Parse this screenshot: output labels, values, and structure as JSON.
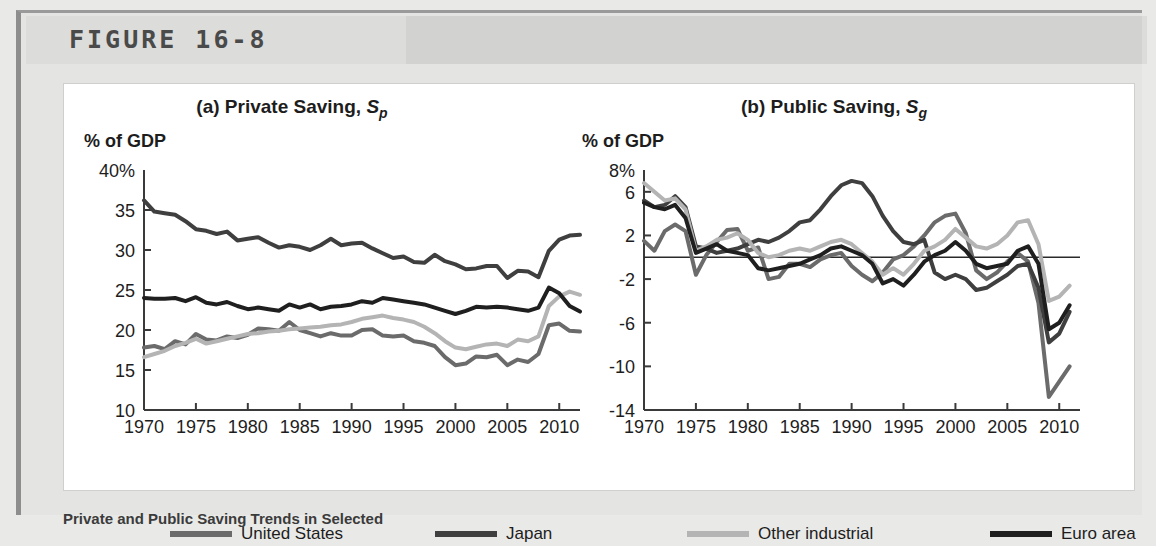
{
  "figure": {
    "label": "FIGURE 16-8",
    "caption": "Private and Public Saving Trends in Selected"
  },
  "panels": [
    {
      "key": "private",
      "title_prefix": "(a) Private Saving, ",
      "title_symbol": "S",
      "title_subscript": "p",
      "axis_unit": "% of GDP"
    },
    {
      "key": "public",
      "title_prefix": "(b) Public Saving, ",
      "title_symbol": "S",
      "title_subscript": "g",
      "axis_unit": "% of GDP"
    }
  ],
  "legend": {
    "items": [
      {
        "label": "United States",
        "color": "#6b6b6b"
      },
      {
        "label": "Japan",
        "color": "#3f3f3f"
      },
      {
        "label": "Other industrial",
        "color": "#b4b4b4"
      },
      {
        "label": "Euro area",
        "color": "#1f1f1f"
      }
    ]
  },
  "chart_data": [
    {
      "type": "line",
      "title": "(a) Private Saving, Sp",
      "xlabel": "",
      "ylabel": "% of GDP",
      "xlim": [
        1970,
        2012
      ],
      "ylim": [
        10,
        40
      ],
      "yticks": [
        10,
        15,
        20,
        25,
        30,
        35,
        40
      ],
      "yticklabels": [
        "10",
        "15",
        "20",
        "25",
        "30",
        "35",
        "40%"
      ],
      "xticks": [
        1970,
        1975,
        1980,
        1985,
        1990,
        1995,
        2000,
        2005,
        2010
      ],
      "xticklabels": [
        "1970",
        "1975",
        "1980",
        "1985",
        "1990",
        "1995",
        "2000",
        "2005",
        "2010"
      ],
      "grid": false,
      "legend": "below",
      "x": [
        1970,
        1971,
        1972,
        1973,
        1974,
        1975,
        1976,
        1977,
        1978,
        1979,
        1980,
        1981,
        1982,
        1983,
        1984,
        1985,
        1986,
        1987,
        1988,
        1989,
        1990,
        1991,
        1992,
        1993,
        1994,
        1995,
        1996,
        1997,
        1998,
        1999,
        2000,
        2001,
        2002,
        2003,
        2004,
        2005,
        2006,
        2007,
        2008,
        2009,
        2010,
        2011,
        2012
      ],
      "series": [
        {
          "name": "United States",
          "color": "#6b6b6b",
          "values": [
            17.8,
            18.0,
            17.6,
            18.6,
            18.2,
            19.5,
            18.8,
            18.7,
            19.2,
            19.0,
            19.4,
            20.2,
            20.1,
            19.9,
            21.0,
            20.0,
            19.6,
            19.2,
            19.6,
            19.3,
            19.3,
            20.0,
            20.1,
            19.3,
            19.2,
            19.3,
            18.6,
            18.4,
            18.0,
            16.6,
            15.6,
            15.8,
            16.7,
            16.6,
            16.9,
            15.6,
            16.3,
            16.0,
            17.0,
            20.6,
            20.8,
            19.9,
            19.8
          ]
        },
        {
          "name": "Japan",
          "color": "#3f3f3f",
          "values": [
            36.2,
            34.8,
            34.6,
            34.4,
            33.6,
            32.6,
            32.4,
            32.0,
            32.3,
            31.2,
            31.4,
            31.6,
            30.9,
            30.3,
            30.6,
            30.4,
            30.0,
            30.6,
            31.4,
            30.6,
            30.8,
            30.9,
            30.2,
            29.6,
            29.0,
            29.2,
            28.5,
            28.4,
            29.4,
            28.6,
            28.2,
            27.6,
            27.7,
            28.0,
            28.0,
            26.5,
            27.4,
            27.3,
            26.6,
            29.9,
            31.3,
            31.8,
            31.9
          ]
        },
        {
          "name": "Other industrial",
          "color": "#b4b4b4",
          "values": [
            16.6,
            17.0,
            17.4,
            18.0,
            18.4,
            18.9,
            18.3,
            18.6,
            18.9,
            19.2,
            19.5,
            19.6,
            19.8,
            19.9,
            20.1,
            20.2,
            20.3,
            20.4,
            20.6,
            20.7,
            21.0,
            21.4,
            21.6,
            21.8,
            21.5,
            21.3,
            21.0,
            20.4,
            19.6,
            18.6,
            17.8,
            17.6,
            17.9,
            18.2,
            18.3,
            18.0,
            18.8,
            18.6,
            19.2,
            23.0,
            24.2,
            24.8,
            24.4
          ]
        },
        {
          "name": "Euro area",
          "color": "#1f1f1f",
          "values": [
            24.0,
            23.9,
            23.9,
            24.0,
            23.6,
            24.1,
            23.4,
            23.2,
            23.5,
            23.0,
            22.6,
            22.8,
            22.6,
            22.4,
            23.2,
            22.8,
            23.2,
            22.6,
            22.9,
            23.0,
            23.2,
            23.6,
            23.4,
            24.0,
            23.8,
            23.6,
            23.4,
            23.2,
            22.8,
            22.4,
            22.0,
            22.4,
            22.9,
            22.8,
            22.9,
            22.8,
            22.6,
            22.4,
            22.8,
            25.3,
            24.6,
            23.0,
            22.3
          ]
        }
      ]
    },
    {
      "type": "line",
      "title": "(b) Public Saving, Sg",
      "xlabel": "",
      "ylabel": "% of GDP",
      "xlim": [
        1970,
        2012
      ],
      "ylim": [
        -14,
        8
      ],
      "yticks": [
        -14,
        -10,
        -6,
        -2,
        2,
        6,
        8
      ],
      "yticklabels": [
        "-14",
        "-10",
        "-6",
        "-2",
        "2",
        "6",
        "8%"
      ],
      "xticks": [
        1970,
        1975,
        1980,
        1985,
        1990,
        1995,
        2000,
        2005,
        2010
      ],
      "xticklabels": [
        "1970",
        "1975",
        "1980",
        "1985",
        "1990",
        "1995",
        "2000",
        "2005",
        "2010"
      ],
      "grid": false,
      "zero_line": true,
      "legend": "below",
      "x": [
        1970,
        1971,
        1972,
        1973,
        1974,
        1975,
        1976,
        1977,
        1978,
        1979,
        1980,
        1981,
        1982,
        1983,
        1984,
        1985,
        1986,
        1987,
        1988,
        1989,
        1990,
        1991,
        1992,
        1993,
        1994,
        1995,
        1996,
        1997,
        1998,
        1999,
        2000,
        2001,
        2002,
        2003,
        2004,
        2005,
        2006,
        2007,
        2008,
        2009,
        2010,
        2011
      ],
      "series": [
        {
          "name": "United States",
          "color": "#6b6b6b",
          "values": [
            1.5,
            0.6,
            2.4,
            3.0,
            2.4,
            -1.6,
            0.2,
            1.4,
            2.5,
            2.6,
            0.6,
            0.9,
            -2.0,
            -1.8,
            -0.6,
            -0.6,
            -0.9,
            -0.2,
            0.2,
            0.4,
            -0.8,
            -1.6,
            -2.2,
            -1.4,
            -0.2,
            0.2,
            1.0,
            2.0,
            3.2,
            3.8,
            4.0,
            2.2,
            -1.2,
            -2.0,
            -1.4,
            -0.4,
            0.4,
            -0.4,
            -4.2,
            -12.8,
            -11.4,
            -10.0
          ]
        },
        {
          "name": "Japan",
          "color": "#3f3f3f",
          "values": [
            5.2,
            4.6,
            4.8,
            5.6,
            4.6,
            1.0,
            0.8,
            0.4,
            0.6,
            0.8,
            1.2,
            1.6,
            1.4,
            1.8,
            2.4,
            3.2,
            3.4,
            4.4,
            5.6,
            6.6,
            7.0,
            6.8,
            5.6,
            3.8,
            2.4,
            1.4,
            1.2,
            1.6,
            -1.4,
            -2.0,
            -1.6,
            -2.0,
            -3.0,
            -2.8,
            -2.2,
            -1.6,
            -0.8,
            -0.6,
            -2.8,
            -7.8,
            -7.0,
            -5.0
          ]
        },
        {
          "name": "Other industrial",
          "color": "#b4b4b4",
          "values": [
            6.8,
            6.0,
            5.2,
            5.4,
            4.4,
            0.6,
            1.0,
            1.6,
            1.8,
            2.2,
            1.6,
            0.4,
            0.0,
            0.2,
            0.6,
            0.8,
            0.6,
            1.0,
            1.4,
            1.6,
            1.2,
            0.4,
            -0.4,
            -1.6,
            -1.0,
            -1.6,
            -0.6,
            0.6,
            1.0,
            1.6,
            2.6,
            1.8,
            1.0,
            0.8,
            1.2,
            2.0,
            3.2,
            3.4,
            1.2,
            -4.0,
            -3.6,
            -2.6
          ]
        },
        {
          "name": "Euro area",
          "color": "#1f1f1f",
          "values": [
            5.0,
            4.6,
            4.4,
            4.8,
            3.6,
            0.4,
            0.8,
            1.2,
            0.6,
            0.4,
            0.2,
            -1.0,
            -1.2,
            -1.0,
            -0.8,
            -0.6,
            -0.2,
            0.2,
            0.8,
            1.0,
            0.6,
            0.2,
            -0.6,
            -2.4,
            -2.0,
            -2.6,
            -1.6,
            -0.4,
            0.2,
            0.6,
            1.4,
            0.6,
            -0.6,
            -1.0,
            -0.8,
            -0.6,
            0.6,
            1.0,
            -0.6,
            -6.6,
            -6.0,
            -4.4
          ]
        }
      ]
    }
  ]
}
